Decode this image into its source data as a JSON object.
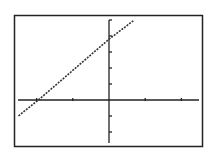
{
  "chart_data": {
    "type": "line",
    "title": "",
    "xlabel": "",
    "ylabel": "",
    "xlim": [
      -2.5,
      2.5
    ],
    "ylim": [
      -2.7,
      5.1
    ],
    "x_ticks": [
      -2,
      -1,
      0,
      1,
      2
    ],
    "y_ticks": [
      -2,
      -1,
      0,
      1,
      2,
      3,
      4,
      5
    ],
    "grid": false,
    "legend": null,
    "series": [
      {
        "name": "y = 1.7x + 3.8",
        "style": "dotted",
        "x": [
          -2.5,
          -1.95,
          0,
          0.7
        ],
        "y": [
          -1.0,
          0.0,
          3.8,
          5.0
        ]
      }
    ]
  },
  "frame_color": "#222222",
  "line_color": "#333333"
}
